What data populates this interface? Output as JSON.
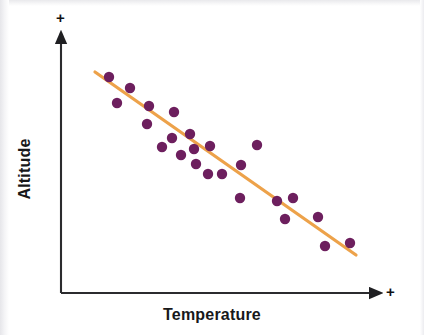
{
  "figure": {
    "kind": "scatter-plot-with-trend-line",
    "background_color": "#ffffff"
  },
  "axes": {
    "x_title": "Temperature",
    "y_title": "Altitude",
    "x_positive_marker": "+",
    "y_positive_marker": "+",
    "axis_color": "#2b2b2e",
    "origin": {
      "x": 61,
      "y": 293
    },
    "x_axis_end": {
      "x": 380,
      "y": 293
    },
    "y_axis_end": {
      "x": 61,
      "y": 33
    }
  },
  "style": {
    "point_color": "#6d1f5e",
    "point_radius": 5.2,
    "trend_line_color": "#eda košt",
    "trend_line_color_hex": "#eda24a",
    "trend_line_width": 3.2
  },
  "chart_data": {
    "type": "scatter",
    "title": "",
    "subtitle": "",
    "xlabel": "Temperature",
    "ylabel": "Altitude",
    "xlim": [
      61,
      380
    ],
    "ylim": [
      293,
      33
    ],
    "grid": false,
    "legend": null,
    "annotations": [
      {
        "text": "+",
        "position": "top of y-axis",
        "meaning": "increasing Altitude"
      },
      {
        "text": "+",
        "position": "right of x-axis",
        "meaning": "increasing Temperature"
      }
    ],
    "relationship": "negative",
    "series": [
      {
        "name": "observations",
        "marker": "circle",
        "color": "#6d1f5e",
        "points": [
          {
            "x": 109,
            "y": 77
          },
          {
            "x": 130,
            "y": 88
          },
          {
            "x": 117,
            "y": 103
          },
          {
            "x": 149,
            "y": 106
          },
          {
            "x": 147,
            "y": 124
          },
          {
            "x": 174,
            "y": 112
          },
          {
            "x": 172,
            "y": 138
          },
          {
            "x": 190,
            "y": 134
          },
          {
            "x": 194,
            "y": 149
          },
          {
            "x": 210,
            "y": 146
          },
          {
            "x": 196,
            "y": 164
          },
          {
            "x": 208,
            "y": 174
          },
          {
            "x": 222,
            "y": 174
          },
          {
            "x": 241,
            "y": 165
          },
          {
            "x": 240,
            "y": 198
          },
          {
            "x": 277,
            "y": 201
          },
          {
            "x": 293,
            "y": 198
          },
          {
            "x": 285,
            "y": 219
          },
          {
            "x": 318,
            "y": 217
          },
          {
            "x": 325,
            "y": 246
          },
          {
            "x": 350,
            "y": 243
          },
          {
            "x": 257,
            "y": 145
          },
          {
            "x": 181,
            "y": 155
          },
          {
            "x": 162,
            "y": 147
          }
        ]
      }
    ],
    "trend_line": {
      "name": "line of best fit",
      "color": "#eda24a",
      "x1": 95,
      "y1": 72,
      "x2": 356,
      "y2": 255,
      "slope_sign": "negative"
    }
  }
}
